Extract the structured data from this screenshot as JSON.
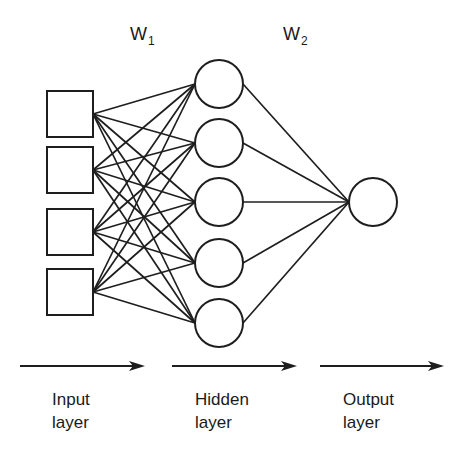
{
  "diagram": {
    "stroke_color": "#1e1e1e",
    "background": "#ffffff",
    "weights": [
      {
        "symbol": "W",
        "subscript": "1",
        "x": 130,
        "y": 25
      },
      {
        "symbol": "W",
        "subscript": "2",
        "x": 283,
        "y": 25
      }
    ],
    "layers": {
      "input": {
        "shape": "square",
        "size": 46,
        "nodes": [
          {
            "id": "i1",
            "x": 47,
            "y": 91
          },
          {
            "id": "i2",
            "x": 47,
            "y": 147
          },
          {
            "id": "i3",
            "x": 47,
            "y": 209
          },
          {
            "id": "i4",
            "x": 47,
            "y": 269
          }
        ]
      },
      "hidden": {
        "shape": "circle",
        "radius": 24,
        "nodes": [
          {
            "id": "h1",
            "cx": 219,
            "cy": 84
          },
          {
            "id": "h2",
            "cx": 219,
            "cy": 143
          },
          {
            "id": "h3",
            "cx": 219,
            "cy": 202
          },
          {
            "id": "h4",
            "cx": 219,
            "cy": 263
          },
          {
            "id": "h5",
            "cx": 219,
            "cy": 323
          }
        ]
      },
      "output": {
        "shape": "circle",
        "radius": 24,
        "nodes": [
          {
            "id": "o1",
            "cx": 373,
            "cy": 202
          }
        ]
      }
    },
    "connections": {
      "input_to_hidden": "fully-connected",
      "hidden_to_output": "fully-connected"
    },
    "arrows": [
      {
        "x1": 20,
        "x2": 145,
        "y": 366
      },
      {
        "x1": 172,
        "x2": 297,
        "y": 366
      },
      {
        "x1": 320,
        "x2": 444,
        "y": 366
      }
    ],
    "layer_labels": [
      {
        "line1": "Input",
        "line2": "layer",
        "x": 52,
        "y": 388
      },
      {
        "line1": "Hidden",
        "line2": "layer",
        "x": 195,
        "y": 388
      },
      {
        "line1": "Output",
        "line2": "layer",
        "x": 343,
        "y": 388
      }
    ]
  }
}
